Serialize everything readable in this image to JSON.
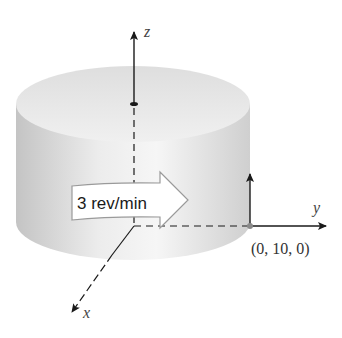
{
  "diagram": {
    "axes": {
      "x_label": "x",
      "y_label": "y",
      "z_label": "z"
    },
    "rotation_label": "3 rev/min",
    "point_label": "(0, 10, 0)",
    "colors": {
      "axis": "#1a1a1a",
      "cylinder_side_light": "#f4f4f4",
      "cylinder_side_dark": "#c8c8c8",
      "cylinder_top": "#e6e6e6",
      "arrow_fill": "#ffffff",
      "arrow_stroke": "#9a9a9a",
      "point": "#8a8a8a"
    }
  }
}
